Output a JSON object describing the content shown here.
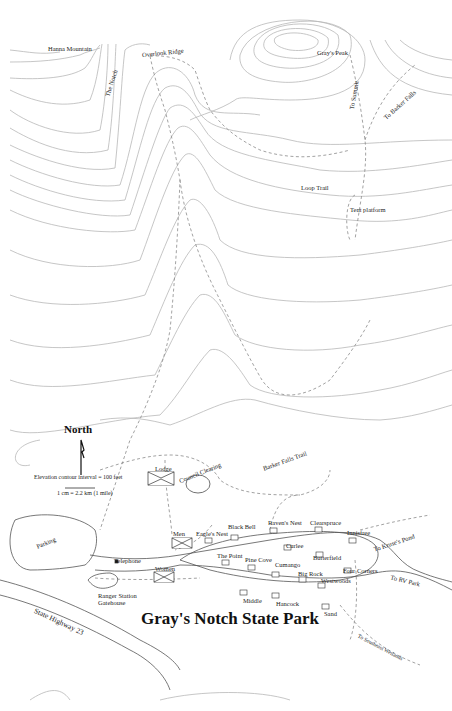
{
  "map": {
    "title": "Gray's Notch State Park",
    "legend": {
      "north_label": "North",
      "contour_interval": "Elevation contour interval = 100 feet",
      "scale": "1 cm = 2.2 km (1 mile)"
    },
    "landmarks": {
      "hanna_mountain": "Hanna Mountain",
      "the_notch": "The Notch",
      "overlook_ridge": "Overlook Ridge",
      "grays_peak": "Gray's Peak",
      "to_summit": "To Summit",
      "to_barker_falls": "To Barker Falls",
      "loop_trail": "Loop Trail",
      "tent_platform": "Tent platform",
      "barker_falls_trail": "Barker Falls Trail",
      "lodge": "Lodge",
      "council_clearing": "Council Clearing",
      "parking": "Parking",
      "telephone": "Telephone",
      "men": "Men",
      "women": "Women",
      "ranger_station": "Ranger Station",
      "gatehouse": "Gatehouse",
      "state_highway": "State Highway 23",
      "to_kruses_pond": "To Kruse's Pond",
      "to_rv_park": "To RV Park",
      "to_southeast_wetlands": "To Southeast Wetlands"
    },
    "cabins": {
      "eagles_nest": "Eagle's Nest",
      "black_bell": "Black Bell",
      "ravens_nest": "Raven's Nest",
      "clearspruce": "Clearspruce",
      "juniper": "Innisfree",
      "curlee": "Curlee",
      "butterfield": "Butterfield",
      "the_point": "The Point",
      "pine_cove": "Pine Cove",
      "cumango": "Cumango",
      "big_rock": "Big Rock",
      "westwoods": "Westwoods",
      "four_corners": "Four Corners",
      "middle": "Middle",
      "hancock": "Hancock",
      "sand": "Sand"
    }
  }
}
